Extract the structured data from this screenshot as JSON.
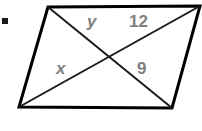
{
  "figure": {
    "type": "geometry-diagram",
    "shape": "parallelogram-with-diagonals",
    "background_color": "#ffffff",
    "outline_color": "#000000",
    "diagonal_color": "#1a1a1a",
    "label_color": "#7f7f7f",
    "outline_width": 3,
    "diagonal_width": 2,
    "canvas": {
      "width": 202,
      "height": 131
    },
    "vertices": {
      "top_left": {
        "x": 48,
        "y": 7
      },
      "top_right": {
        "x": 200,
        "y": 6
      },
      "bottom_right": {
        "x": 172,
        "y": 108
      },
      "bottom_left": {
        "x": 19,
        "y": 107
      }
    },
    "diagonal_intersection": {
      "x": 110,
      "y": 57
    },
    "diagonals": [
      {
        "name": "top-left-to-bottom-right",
        "from": "top_left",
        "to": "bottom_right"
      },
      {
        "name": "bottom-left-to-top-right",
        "from": "bottom_left",
        "to": "top_right"
      }
    ],
    "labels": [
      {
        "id": "y",
        "text": "y",
        "style": "italic",
        "segment": "top-left-vertex-to-intersection",
        "position": {
          "x": 87,
          "y": 13
        }
      },
      {
        "id": "12",
        "text": "12",
        "style": "normal",
        "segment": "intersection-to-top-right-vertex",
        "position": {
          "x": 129,
          "y": 13
        }
      },
      {
        "id": "x",
        "text": "x",
        "style": "italic",
        "segment": "bottom-left-vertex-to-intersection",
        "position": {
          "x": 56,
          "y": 60
        }
      },
      {
        "id": "9",
        "text": "9",
        "style": "normal",
        "segment": "intersection-to-bottom-right-vertex",
        "position": {
          "x": 137,
          "y": 60
        }
      }
    ],
    "bullet_mark": {
      "x": 2,
      "y": 18,
      "size": 6,
      "color": "#1a1a1a"
    }
  }
}
